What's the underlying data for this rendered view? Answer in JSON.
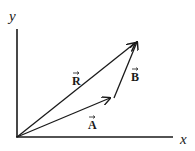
{
  "diagram": {
    "type": "vector-addition",
    "axes": {
      "x_label": "x",
      "y_label": "y",
      "origin": [
        17,
        137
      ],
      "x_end": [
        174,
        137
      ],
      "y_end": [
        17,
        29
      ]
    },
    "vectors": [
      {
        "name": "A",
        "label": "A",
        "from": [
          17,
          137
        ],
        "to": [
          110,
          98
        ]
      },
      {
        "name": "B",
        "label": "B",
        "from": [
          114,
          98
        ],
        "to": [
          137,
          42
        ]
      },
      {
        "name": "R",
        "label": "R",
        "from": [
          17,
          137
        ],
        "to": [
          136,
          42
        ]
      }
    ],
    "labels": {
      "R": {
        "x": 72,
        "y": 85
      },
      "B": {
        "x": 131,
        "y": 81
      },
      "A": {
        "x": 88,
        "y": 129
      }
    },
    "colors": {
      "stroke": "#1a1a1a",
      "background": "#ffffff"
    },
    "relation": "R = A + B"
  }
}
